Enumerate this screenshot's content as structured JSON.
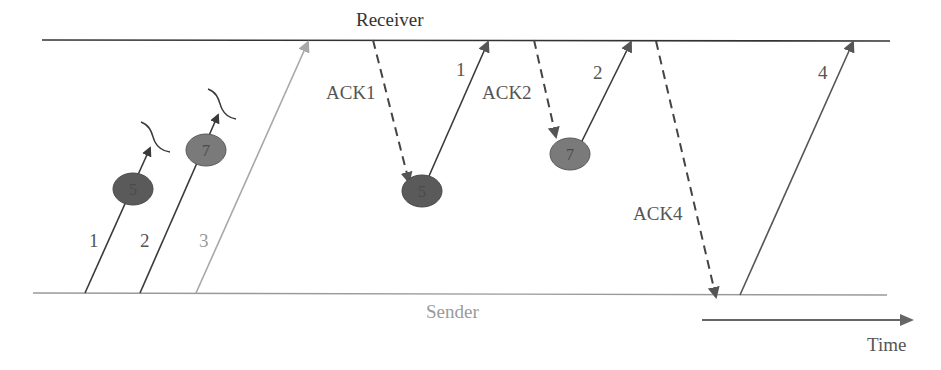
{
  "diagram": {
    "receiver_label": "Receiver",
    "sender_label": "Sender",
    "time_label": "Time",
    "colors": {
      "receiver_line": "#333333",
      "sender_line": "#9a9a9a",
      "packet_dark": "#3a3a3a",
      "packet_light": "#a8a8a8",
      "ack": "#444444",
      "circle_dark": "#5a5a5a",
      "circle_mid": "#7a7a7a",
      "time_arrow": "#666666"
    },
    "initial_packets": [
      {
        "label": "1",
        "status": "lost",
        "passes_node": "5"
      },
      {
        "label": "2",
        "status": "lost",
        "passes_node": "7"
      },
      {
        "label": "3",
        "status": "delivered"
      }
    ],
    "acks": [
      {
        "label": "ACK1",
        "triggers_node": "5",
        "retransmit": "1"
      },
      {
        "label": "ACK2",
        "triggers_node": "7",
        "retransmit": "2"
      },
      {
        "label": "ACK4",
        "retransmit": "4"
      }
    ],
    "nodes": [
      {
        "label": "5"
      },
      {
        "label": "7"
      },
      {
        "label": "5"
      },
      {
        "label": "7"
      }
    ],
    "retransmissions": [
      {
        "label": "1"
      },
      {
        "label": "2"
      },
      {
        "label": "4"
      }
    ]
  }
}
